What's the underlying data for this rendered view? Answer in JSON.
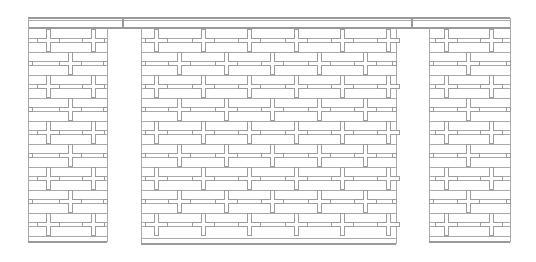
{
  "drawing": {
    "type": "wall-elevation",
    "width": 536,
    "height": 262,
    "line_color": "#a9a9a9",
    "cross_color": "#9c9c9c",
    "background": "#ffffff",
    "beam": {
      "x1": 28,
      "x2": 510,
      "y_top": 18,
      "y_bottom": 28,
      "ticks_x": [
        123,
        412
      ]
    },
    "panels": [
      {
        "name": "left-pier",
        "x1": 28,
        "x2": 107,
        "bottom": 242,
        "cross_cols_a": [
          48,
          93
        ],
        "cross_cols_b": [
          70
        ]
      },
      {
        "name": "center-panel",
        "x1": 141,
        "x2": 396,
        "bottom": 244,
        "cross_cols_a": [
          156,
          203,
          249,
          296,
          342,
          388
        ],
        "cross_cols_b": [
          179,
          226,
          272,
          319,
          365
        ]
      },
      {
        "name": "right-pier",
        "x1": 429,
        "x2": 510,
        "bottom": 242,
        "cross_cols_a": [
          446,
          491
        ],
        "cross_cols_b": [
          468
        ]
      }
    ],
    "rows_y": [
      40,
      63,
      86,
      109,
      132,
      155,
      178,
      201,
      224
    ],
    "cross": {
      "arm_length": 22,
      "arm_width": 4
    },
    "rail_offset": 4
  }
}
